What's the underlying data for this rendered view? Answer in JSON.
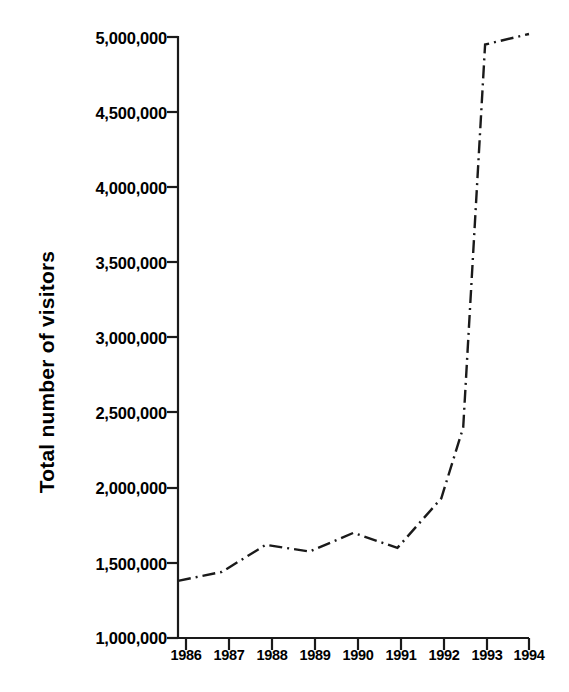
{
  "chart_data": {
    "type": "line",
    "title": "",
    "subtitle": "",
    "xlabel": "",
    "ylabel": "Total number of visitors",
    "categories": [
      "1986",
      "1987",
      "1988",
      "1989",
      "1990",
      "1991",
      "1992",
      "1993",
      "1994"
    ],
    "x": [
      1986,
      1987,
      1988,
      1989,
      1990,
      1991,
      1992,
      1993,
      1994
    ],
    "values": [
      1380000,
      1440000,
      1620000,
      1575000,
      1700000,
      1600000,
      1930000,
      4950000,
      5020000
    ],
    "interior_vertices": [
      {
        "x": 1992.5,
        "y": 2400000,
        "note": "mid-1992 bend on the steep rise"
      }
    ],
    "series": [
      {
        "name": "Total number of visitors",
        "values": [
          1380000,
          1440000,
          1620000,
          1575000,
          1700000,
          1600000,
          1930000,
          4950000,
          5020000
        ],
        "line_style": "dash-dot",
        "color": "#1a1a1a",
        "markers": "none"
      }
    ],
    "ylim": [
      1000000,
      5000000
    ],
    "xlim": [
      1986,
      1994
    ],
    "ytick_values": [
      1000000,
      1500000,
      2000000,
      2500000,
      3000000,
      3500000,
      4000000,
      4500000,
      5000000
    ],
    "ytick_labels": [
      "1,000,000",
      "1,500,000",
      "2,000,000",
      "2,500,000",
      "3,000,000",
      "3,500,000",
      "4,000,000",
      "4,500,000",
      "5,000,000"
    ],
    "xtick_labels": [
      "1986",
      "1987",
      "1988",
      "1989",
      "1990",
      "1991",
      "1992",
      "1993",
      "1994"
    ],
    "grid": false,
    "legend": false,
    "legend_position": "none",
    "annotations": [],
    "axis_color": "#1a1a1a",
    "background": "#ffffff"
  },
  "axes": {
    "y_title": "Total number of visitors",
    "y_ticks": [
      {
        "label": "5,000,000",
        "value": 5000000
      },
      {
        "label": "4,500,000",
        "value": 4500000
      },
      {
        "label": "4,000,000",
        "value": 4000000
      },
      {
        "label": "3,500,000",
        "value": 3500000
      },
      {
        "label": "3,000,000",
        "value": 3000000
      },
      {
        "label": "2,500,000",
        "value": 2500000
      },
      {
        "label": "2,000,000",
        "value": 2000000
      },
      {
        "label": "1,500,000",
        "value": 1500000
      },
      {
        "label": "1,000,000",
        "value": 1000000
      }
    ],
    "x_ticks": [
      {
        "label": "1986"
      },
      {
        "label": "1987"
      },
      {
        "label": "1988"
      },
      {
        "label": "1989"
      },
      {
        "label": "1990"
      },
      {
        "label": "1991"
      },
      {
        "label": "1992"
      },
      {
        "label": "1993"
      },
      {
        "label": "1994"
      }
    ]
  }
}
